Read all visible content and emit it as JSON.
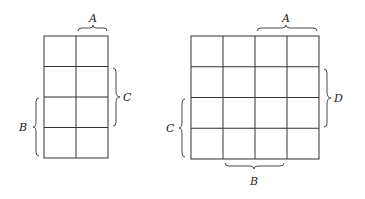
{
  "diagram": {
    "type": "karnaugh-map-templates",
    "maps": [
      {
        "name": "three-variable-map",
        "rows": 4,
        "cols": 2,
        "labels": {
          "top": "A",
          "right": "C",
          "left": "B"
        }
      },
      {
        "name": "four-variable-map",
        "rows": 4,
        "cols": 4,
        "labels": {
          "top": "A",
          "right": "D",
          "left": "C",
          "bottom": "B"
        }
      }
    ]
  }
}
